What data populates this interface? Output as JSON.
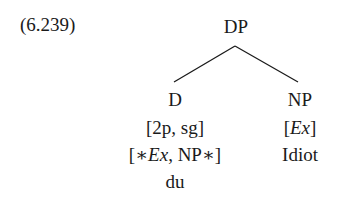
{
  "example": {
    "number": "(6.239)"
  },
  "tree": {
    "root": {
      "label": "DP"
    },
    "children": [
      {
        "label": "D",
        "features": [
          "[2p, sg]"
        ],
        "selection": {
          "open": "[∗",
          "ex": "Ex",
          "rest": ", NP∗]"
        },
        "word": "du"
      },
      {
        "label": "NP",
        "features": {
          "open": "[",
          "ex": "Ex",
          "close": "]"
        },
        "word": "Idiot"
      }
    ]
  },
  "colors": {
    "text": "#1a1a1a",
    "line": "#1a1a1a",
    "background": "#ffffff"
  }
}
